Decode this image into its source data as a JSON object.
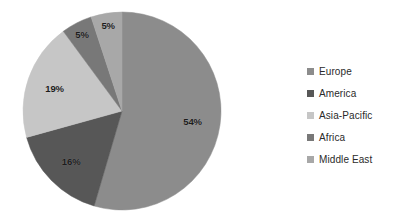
{
  "chart_data": {
    "type": "pie",
    "title": "",
    "subtitle": "",
    "xlabel": "",
    "ylabel": "",
    "grid": false,
    "legend_position": "right",
    "start_angle_deg": 0,
    "direction": "clockwise",
    "categories": [
      "Europe",
      "America",
      "Asia-Pacific",
      "Africa",
      "Middle East"
    ],
    "values": [
      54,
      16,
      19,
      5,
      5
    ],
    "value_unit": "%",
    "data_labels": [
      "54%",
      "16%",
      "19%",
      "5%",
      "5%"
    ],
    "slice_colors": [
      "#8c8c8c",
      "#575757",
      "#c6c6c6",
      "#787878",
      "#a8a8a8"
    ],
    "slices": [
      {
        "label": "Europe",
        "value": 54,
        "data_label": "54%",
        "color": "#8c8c8c"
      },
      {
        "label": "America",
        "value": 16,
        "data_label": "16%",
        "color": "#575757"
      },
      {
        "label": "Asia-Pacific",
        "value": 19,
        "data_label": "19%",
        "color": "#c6c6c6"
      },
      {
        "label": "Africa",
        "value": 5,
        "data_label": "5%",
        "color": "#787878"
      },
      {
        "label": "Middle East",
        "value": 5,
        "data_label": "5%",
        "color": "#a8a8a8"
      }
    ]
  },
  "legend": {
    "items": [
      {
        "label": "Europe",
        "color": "#8c8c8c"
      },
      {
        "label": "America",
        "color": "#575757"
      },
      {
        "label": "Asia-Pacific",
        "color": "#c6c6c6"
      },
      {
        "label": "Africa",
        "color": "#787878"
      },
      {
        "label": "Middle East",
        "color": "#a8a8a8"
      }
    ]
  },
  "background_color": "#ffffff"
}
